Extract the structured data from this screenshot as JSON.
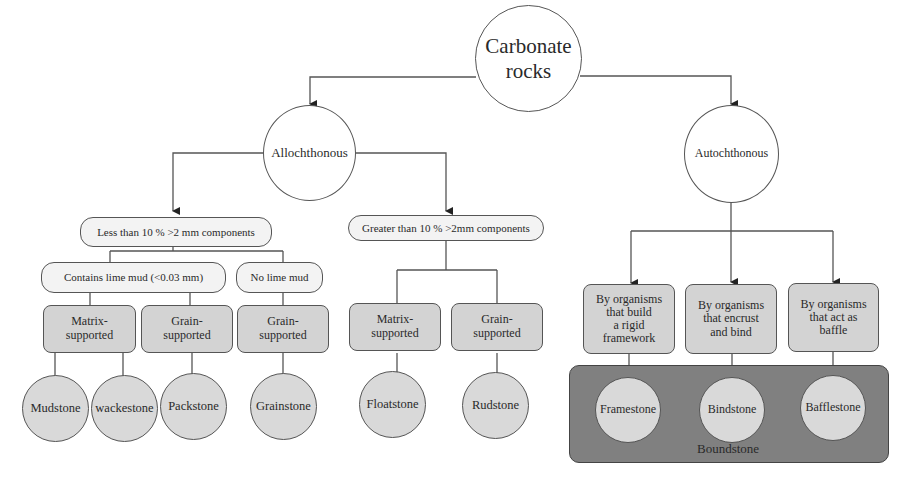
{
  "diagram": {
    "root": {
      "label_line1": "Carbonate",
      "label_line2": "rocks"
    },
    "level1": {
      "left": {
        "label": "Allochthonous"
      },
      "right": {
        "label": "Autochthonous"
      }
    },
    "allochthonous": {
      "less": {
        "label": "Less than 10 % >2 mm components"
      },
      "greater": {
        "label": "Greater than 10 % >2mm components"
      },
      "contains_lime_mud": {
        "label": "Contains lime mud (<0.03 mm)"
      },
      "no_lime_mud": {
        "label": "No lime mud"
      },
      "support": [
        {
          "line1": "Matrix-",
          "line2": "supported"
        },
        {
          "line1": "Grain-",
          "line2": "supported"
        },
        {
          "line1": "Grain-",
          "line2": "supported"
        },
        {
          "line1": "Matrix-",
          "line2": "supported"
        },
        {
          "line1": "Grain-",
          "line2": "supported"
        }
      ],
      "rocks": [
        "Mudstone",
        "wackestone",
        "Packstone",
        "Grainstone",
        "Floatstone",
        "Rudstone"
      ]
    },
    "autochthonous": {
      "organisms": [
        {
          "lines": [
            "By organisms",
            "that build",
            "a rigid",
            "framework"
          ]
        },
        {
          "lines": [
            "By organisms",
            "that encrust",
            "and bind"
          ]
        },
        {
          "lines": [
            "By organisms",
            "that act as",
            "baffle"
          ]
        }
      ],
      "rocks": [
        "Framestone",
        "Bindstone",
        "Bafflestone"
      ],
      "group_label": "Boundstone"
    },
    "colors": {
      "line": "#555555",
      "grey_node": "#d9d9d9",
      "box_fill": "#d3d3d3",
      "pill_fill": "#f3f3f3",
      "panel_fill": "#808080"
    }
  }
}
